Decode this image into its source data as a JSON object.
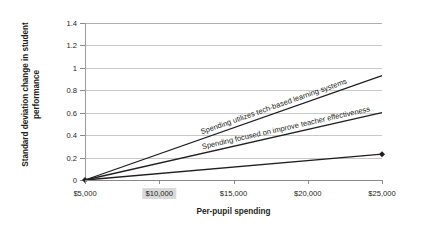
{
  "chart_data": {
    "type": "line",
    "title": "",
    "subtitle": "",
    "xlabel": "Per-pupil spending",
    "ylabel": "Standard deviation change in student performance",
    "x": [
      5000,
      25000
    ],
    "xlim": [
      5000,
      25000
    ],
    "ylim": [
      0,
      1.4
    ],
    "grid": true,
    "legend_position": "inline-labels",
    "x_tick_labels": [
      "$5,000",
      "$10,000",
      "$15,000",
      "$20,000",
      "$25,000"
    ],
    "x_tick_values": [
      5000,
      10000,
      15000,
      20000,
      25000
    ],
    "x_highlighted_tick": "$10,000",
    "y_tick_labels": [
      "0",
      "0.2",
      "0.4",
      "0.6",
      "0.8",
      "1",
      "1.2",
      "1.4"
    ],
    "y_tick_values": [
      0,
      0.2,
      0.4,
      0.6,
      0.8,
      1.0,
      1.2,
      1.4
    ],
    "series": [
      {
        "name": "Spending utilizes tech-based learning systems",
        "values": [
          0,
          0.93
        ],
        "color": "#231f20",
        "marker": "none"
      },
      {
        "name": "Spending focused on improve teacher effectiveness",
        "values": [
          0,
          0.6
        ],
        "color": "#231f20",
        "marker": "none"
      },
      {
        "name": "baseline",
        "values": [
          0,
          0.23
        ],
        "color": "#231f20",
        "marker": "diamond"
      }
    ]
  },
  "axes": {
    "y_title": "Standard deviation change in student performance",
    "x_title": "Per-pupil spending",
    "y_ticks": [
      "1.4",
      "1.2",
      "1",
      "0.8",
      "0.6",
      "0.4",
      "0.2",
      "0"
    ],
    "x_ticks": [
      "$5,000",
      "$10,000",
      "$15,000",
      "$20,000",
      "$25,000"
    ]
  },
  "annotations": {
    "line_1_label": "Spending utilizes tech-based learning systems",
    "line_2_label": "Spending focused on improve teacher effectiveness"
  },
  "colors": {
    "line": "#231f20",
    "grid": "#c8c8c8",
    "axis": "#8a8a8a",
    "highlight_bg": "#d9d9d9",
    "text": "#231f20",
    "background": "#ffffff"
  }
}
